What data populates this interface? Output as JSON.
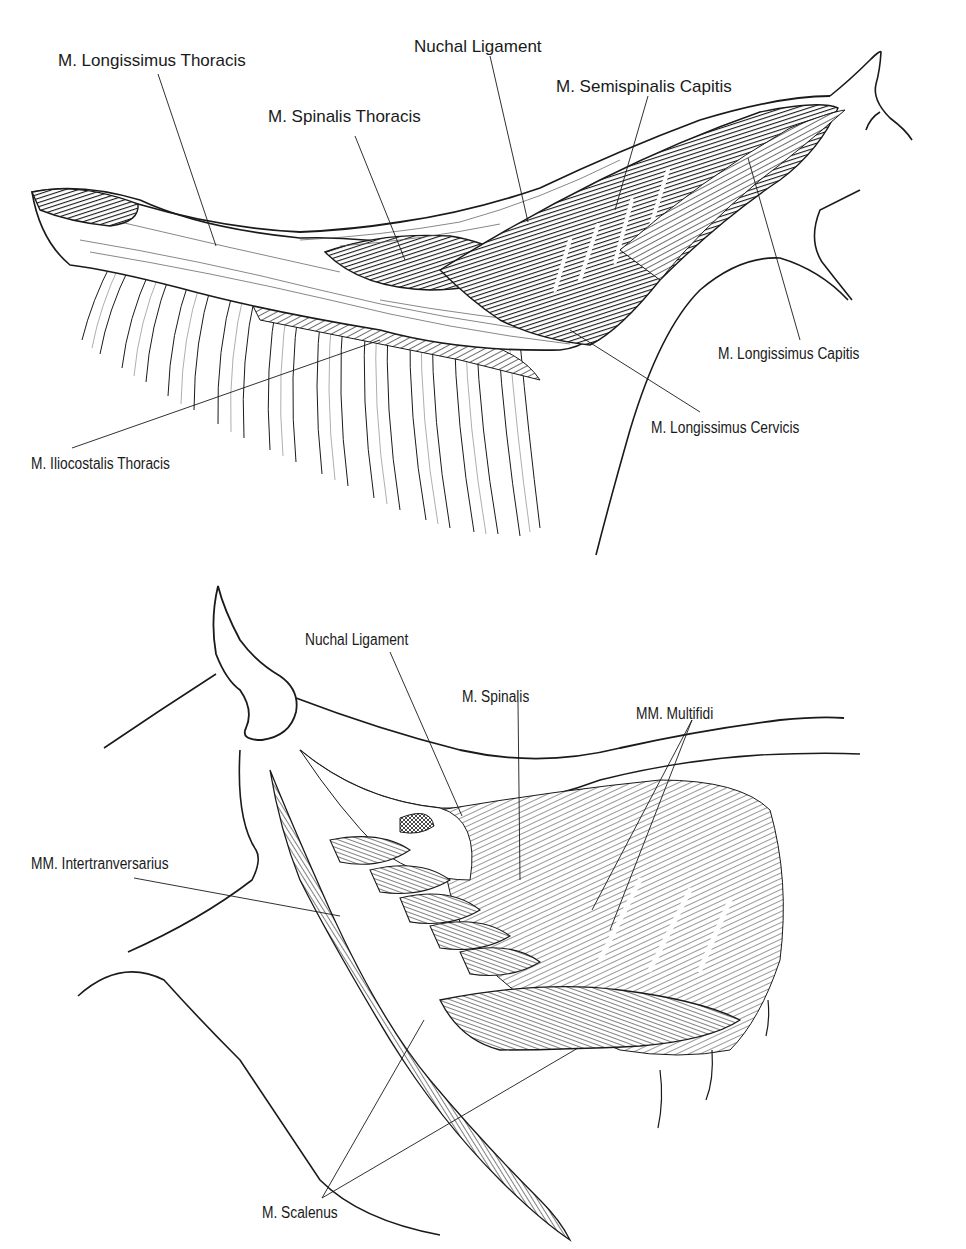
{
  "figures": [
    {
      "id": "top",
      "description": "Lateral view of equine epaxial muscles of the thorax and neck",
      "labels": [
        {
          "text": "M. Longissimus Thoracis",
          "x": 58,
          "y": 52
        },
        {
          "text": "Nuchal Ligament",
          "x": 414,
          "y": 38
        },
        {
          "text": "M. Semispinalis Capitis",
          "x": 556,
          "y": 78
        },
        {
          "text": "M. Spinalis Thoracis",
          "x": 268,
          "y": 108
        },
        {
          "text": "M. Longissimus Capitis",
          "x": 718,
          "y": 346
        },
        {
          "text": "M. Longissimus Cervicis",
          "x": 651,
          "y": 420
        },
        {
          "text": "M. Iliocostalis Thoracis",
          "x": 31,
          "y": 456
        }
      ]
    },
    {
      "id": "bottom",
      "description": "Deep muscles of the equine neck",
      "labels": [
        {
          "text": "Nuchal Ligament",
          "x": 305,
          "y": 52
        },
        {
          "text": "M. Spinalis",
          "x": 462,
          "y": 109
        },
        {
          "text": "MM. Multifidi",
          "x": 636,
          "y": 126
        },
        {
          "text": "MM. Intertranversarius",
          "x": 31,
          "y": 276
        },
        {
          "text": "M. Scalenus",
          "x": 262,
          "y": 625
        }
      ]
    }
  ],
  "colors": {
    "ink": "#1a1a1a",
    "background": "#ffffff",
    "muscle_dark": "#3a3a3a",
    "muscle_mid": "#8a8a8a"
  }
}
